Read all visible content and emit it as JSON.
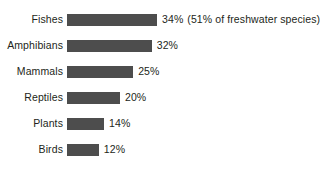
{
  "chart_data": {
    "type": "bar",
    "orientation": "horizontal",
    "title": "",
    "subtitle": "",
    "xlabel": "",
    "ylabel": "",
    "grid": false,
    "legend": "none",
    "xlim": [
      0,
      34
    ],
    "value_suffix": "%",
    "categories": [
      "Fishes",
      "Amphibians",
      "Mammals",
      "Reptiles",
      "Plants",
      "Birds"
    ],
    "values": [
      34,
      32,
      25,
      20,
      14,
      12
    ],
    "value_labels": [
      "34%",
      "32%",
      "25%",
      "20%",
      "14%",
      "12%"
    ],
    "annotations": [
      "(51% of freshwater species)",
      "",
      "",
      "",
      "",
      ""
    ]
  },
  "style": {
    "bar_color": "#4d4d4d",
    "text_color": "#231f20",
    "background": "#ffffff"
  },
  "rows": [
    {
      "label": "Fishes",
      "value": 34,
      "value_label": "34%",
      "annotation": "(51% of freshwater species)"
    },
    {
      "label": "Amphibians",
      "value": 32,
      "value_label": "32%",
      "annotation": ""
    },
    {
      "label": "Mammals",
      "value": 25,
      "value_label": "25%",
      "annotation": ""
    },
    {
      "label": "Reptiles",
      "value": 20,
      "value_label": "20%",
      "annotation": ""
    },
    {
      "label": "Plants",
      "value": 14,
      "value_label": "14%",
      "annotation": ""
    },
    {
      "label": "Birds",
      "value": 12,
      "value_label": "12%",
      "annotation": ""
    }
  ]
}
